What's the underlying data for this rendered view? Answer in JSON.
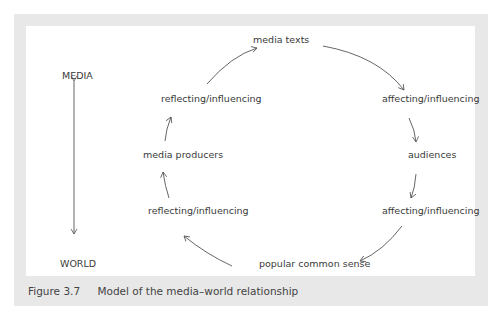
{
  "figure": {
    "number": "Figure 3.7",
    "caption": "Model of the media–world relationship"
  },
  "axis": {
    "top_label": "MEDIA",
    "bottom_label": "WORLD"
  },
  "cycle_nodes": {
    "media_texts": "media texts",
    "affecting_1": "affecting/influencing",
    "audiences": "audiences",
    "affecting_2": "affecting/influencing",
    "popular_common_sense": "popular common sense",
    "reflecting_1": "reflecting/influencing",
    "media_producers": "media producers",
    "reflecting_2": "reflecting/influencing"
  },
  "colors": {
    "frame": "#e8e8e8",
    "text": "#3a3a3a",
    "line": "#555555"
  }
}
